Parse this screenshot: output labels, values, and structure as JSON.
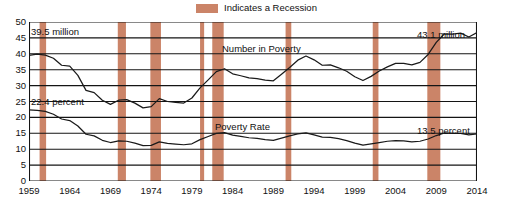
{
  "legend": {
    "swatch_name": "recession-swatch",
    "label": "Indicates a Recession",
    "color": "#cb8468"
  },
  "annotations": {
    "start_number": "39.5 million",
    "start_rate": "22.4 percent",
    "end_number": "43.1 million",
    "end_rate": "13.5 percent",
    "series_number_label": "Number in Poverty",
    "series_rate_label": "Poverty Rate"
  },
  "chart_data": {
    "type": "line",
    "title": "",
    "xlabel": "",
    "ylabel": "",
    "xlim": [
      1959,
      2014
    ],
    "ylim": [
      0,
      50
    ],
    "grid": true,
    "legend_position": "top-right",
    "ytick_labels": [
      "0",
      "5",
      "10",
      "15",
      "20",
      "25",
      "30",
      "35",
      "40",
      "45",
      "50"
    ],
    "yticks": [
      0,
      5,
      10,
      15,
      20,
      25,
      30,
      35,
      40,
      45,
      50
    ],
    "xtick_labels": [
      "1959",
      "1964",
      "1969",
      "1974",
      "1979",
      "1984",
      "1989",
      "1994",
      "1999",
      "2004",
      "2009",
      "2014"
    ],
    "xticks": [
      1959,
      1964,
      1969,
      1974,
      1979,
      1984,
      1989,
      1994,
      1999,
      2004,
      2009,
      2014
    ],
    "x": [
      1959,
      1960,
      1961,
      1962,
      1963,
      1964,
      1965,
      1966,
      1967,
      1968,
      1969,
      1970,
      1971,
      1972,
      1973,
      1974,
      1975,
      1976,
      1977,
      1978,
      1979,
      1980,
      1981,
      1982,
      1983,
      1984,
      1985,
      1986,
      1987,
      1988,
      1989,
      1990,
      1991,
      1992,
      1993,
      1994,
      1995,
      1996,
      1997,
      1998,
      1999,
      2000,
      2001,
      2002,
      2003,
      2004,
      2005,
      2006,
      2007,
      2008,
      2009,
      2010,
      2011,
      2012,
      2013,
      2014
    ],
    "series": [
      {
        "name": "Number in Poverty",
        "units": "millions",
        "color": "#1a1a1a",
        "values": [
          39.5,
          39.9,
          39.6,
          38.6,
          36.4,
          36.1,
          33.2,
          28.5,
          27.8,
          25.4,
          24.1,
          25.4,
          25.6,
          24.5,
          23.0,
          23.4,
          25.9,
          25.0,
          24.7,
          24.5,
          26.1,
          29.3,
          31.8,
          34.4,
          35.3,
          33.7,
          33.1,
          32.4,
          32.2,
          31.7,
          31.5,
          33.6,
          35.7,
          38.0,
          39.3,
          38.1,
          36.4,
          36.5,
          35.6,
          34.5,
          32.8,
          31.6,
          32.9,
          34.6,
          35.9,
          37.0,
          37.0,
          36.5,
          37.3,
          39.8,
          43.6,
          46.3,
          46.2,
          46.5,
          45.3,
          46.7
        ]
      },
      {
        "name": "Poverty Rate",
        "units": "percent",
        "color": "#1a1a1a",
        "values": [
          22.4,
          22.2,
          21.9,
          21.0,
          19.5,
          19.0,
          17.3,
          14.7,
          14.2,
          12.8,
          12.1,
          12.6,
          12.5,
          11.9,
          11.1,
          11.2,
          12.3,
          11.8,
          11.6,
          11.4,
          11.7,
          13.0,
          14.0,
          15.0,
          15.2,
          14.4,
          14.0,
          13.6,
          13.4,
          13.0,
          12.8,
          13.5,
          14.2,
          14.8,
          15.1,
          14.5,
          13.8,
          13.7,
          13.3,
          12.7,
          11.9,
          11.3,
          11.7,
          12.1,
          12.5,
          12.7,
          12.6,
          12.3,
          12.5,
          13.2,
          14.3,
          15.1,
          15.0,
          15.0,
          14.5,
          14.8
        ]
      }
    ],
    "recessions": [
      {
        "start": 1960.3,
        "end": 1961.1
      },
      {
        "start": 1969.9,
        "end": 1970.9
      },
      {
        "start": 1973.9,
        "end": 1975.2
      },
      {
        "start": 1980.0,
        "end": 1980.5
      },
      {
        "start": 1981.5,
        "end": 1982.9
      },
      {
        "start": 1990.5,
        "end": 1991.2
      },
      {
        "start": 2001.2,
        "end": 2001.9
      },
      {
        "start": 2007.9,
        "end": 2009.5
      }
    ]
  }
}
